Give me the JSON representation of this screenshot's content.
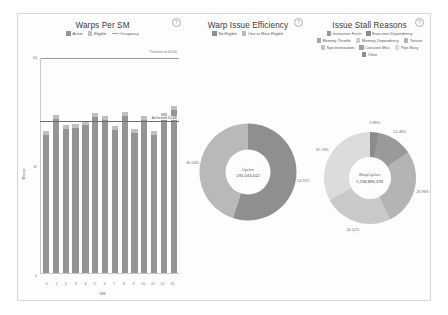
{
  "panels": {
    "warps_per_sm": {
      "title": "Warps Per SM",
      "help": "?",
      "legend": [
        {
          "label": "Active",
          "color": "#949494",
          "kind": "swatch"
        },
        {
          "label": "Eligible",
          "color": "#bfbfbf",
          "kind": "swatch"
        },
        {
          "label": "Occupancy",
          "color": "#9b9b9b",
          "kind": "line"
        }
      ],
      "y_axis_label": "Warps",
      "x_axis_label": "SM",
      "theoretical_label": "Theoretical 64.00",
      "achieved_label": "Achieved 45.49",
      "y_ticks": [
        "64",
        "32",
        "0"
      ]
    },
    "warp_issue_efficiency": {
      "title": "Warp Issue Efficiency",
      "help": "?",
      "legend": [
        {
          "label": "No Eligible",
          "color": "#8f8f8f",
          "kind": "swatch"
        },
        {
          "label": "One or More Eligible",
          "color": "#b9b9b9",
          "kind": "swatch"
        }
      ],
      "center_title": "Cycles",
      "center_value": "191,044,612",
      "labels": [
        {
          "text": "45.04%"
        },
        {
          "text": "54.91%"
        }
      ]
    },
    "issue_stall_reasons": {
      "title": "Issue Stall Reasons",
      "help": "?",
      "legend": [
        {
          "label": "Instruction Fetch",
          "color": "#9a9a9a",
          "kind": "swatch"
        },
        {
          "label": "Execution Dependency",
          "color": "#8c8c8c",
          "kind": "swatch"
        },
        {
          "label": "Memory Throttle",
          "color": "#a6a6a6",
          "kind": "swatch"
        },
        {
          "label": "Memory Dependency",
          "color": "#cfcfcf",
          "kind": "swatch"
        },
        {
          "label": "Texture",
          "color": "#b4b4b4",
          "kind": "swatch"
        },
        {
          "label": "Synchronization",
          "color": "#c4c4c4",
          "kind": "swatch"
        },
        {
          "label": "Constant Miss",
          "color": "#9f9f9f",
          "kind": "swatch"
        },
        {
          "label": "Pipe Busy",
          "color": "#dadada",
          "kind": "swatch"
        },
        {
          "label": "Other",
          "color": "#8f8f8f",
          "kind": "swatch"
        }
      ],
      "center_title": "WarpCycles",
      "center_value": "1,258,896,478",
      "labels": [
        {
          "text": "2.98%"
        },
        {
          "text": "12.46%"
        },
        {
          "text": "26.96%"
        },
        {
          "text": "24.12%"
        },
        {
          "text": "32.74%"
        }
      ]
    }
  },
  "chart_data": [
    {
      "type": "bar",
      "title": "Warps Per SM",
      "xlabel": "SM",
      "ylabel": "Warps",
      "ylim": [
        0,
        64
      ],
      "grid": false,
      "legend_position": "top",
      "categories": [
        "0",
        "1",
        "2",
        "3",
        "4",
        "5",
        "6",
        "7",
        "8",
        "9",
        "10",
        "11",
        "12",
        "13"
      ],
      "series": [
        {
          "name": "Active",
          "values": [
            41.2,
            45.8,
            43.0,
            43.3,
            44.0,
            46.4,
            45.5,
            42.6,
            46.6,
            41.8,
            45.4,
            41.2,
            45.6,
            48.4
          ]
        },
        {
          "name": "Eligible",
          "values": [
            1.1,
            1.2,
            1.1,
            1.1,
            1.2,
            1.3,
            1.2,
            1.1,
            1.3,
            1.1,
            1.2,
            1.1,
            1.9,
            1.4
          ]
        }
      ],
      "annotations": [
        {
          "label": "Theoretical 64.00",
          "value": 64.0
        },
        {
          "label": "Achieved 45.49",
          "value": 45.49
        }
      ]
    },
    {
      "type": "pie",
      "title": "Warp Issue Efficiency",
      "center_title": "Cycles",
      "center_value": 191044612,
      "legend_position": "top",
      "categories": [
        "No Eligible",
        "One or More Eligible"
      ],
      "values": [
        54.91,
        45.04
      ],
      "labels": [
        "54.91%",
        "45.04%"
      ],
      "colors": [
        "#8f8f8f",
        "#b9b9b9"
      ]
    },
    {
      "type": "pie",
      "title": "Issue Stall Reasons",
      "center_title": "WarpCycles",
      "center_value": 1258896478,
      "legend_position": "top",
      "categories": [
        "Instruction Fetch",
        "Execution Dependency",
        "Memory Dependency",
        "Texture",
        "Other"
      ],
      "values": [
        2.98,
        12.46,
        26.96,
        24.12,
        32.74
      ],
      "labels": [
        "2.98%",
        "12.46%",
        "26.96%",
        "24.12%",
        "32.74%"
      ],
      "colors": [
        "#8c8c8c",
        "#9a9a9a",
        "#b4b4b4",
        "#c9c9c9",
        "#dcdcdc"
      ]
    }
  ]
}
